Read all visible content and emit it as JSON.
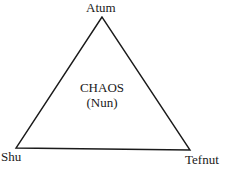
{
  "diagram": {
    "vertices": {
      "top": "Atum",
      "bottom_left": "Shu",
      "bottom_right": "Tefnut"
    },
    "center": {
      "line1": "CHAOS",
      "line2": "(Nun)"
    },
    "stroke_color": "#1a1a1a"
  }
}
